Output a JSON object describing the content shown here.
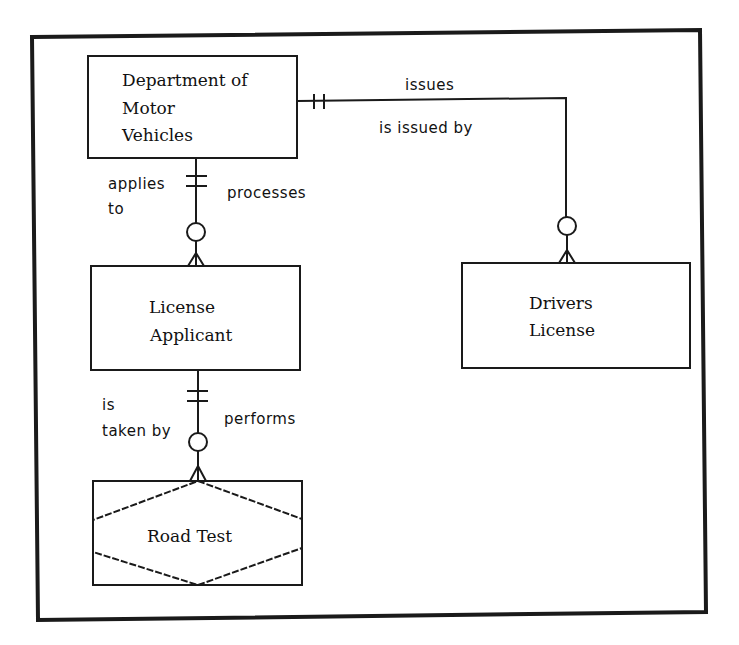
{
  "diagram": {
    "type": "entity-relationship",
    "colors": {
      "line": "#1a1a1a",
      "background": "#ffffff",
      "text": "#111111"
    },
    "entities": [
      {
        "id": "dmv",
        "kind": "entity",
        "lines": [
          "Department of",
          "Motor",
          "Vehicles"
        ]
      },
      {
        "id": "applicant",
        "kind": "entity",
        "lines": [
          "License",
          "Applicant"
        ]
      },
      {
        "id": "drivers_license",
        "kind": "entity",
        "lines": [
          "Drivers",
          "License"
        ]
      },
      {
        "id": "road_test",
        "kind": "associative-entity",
        "lines": [
          "Road Test"
        ]
      }
    ],
    "relationships": [
      {
        "from": "dmv",
        "to": "drivers_license",
        "forward_label": "issues",
        "reverse_label": "is issued by",
        "from_cardinality": "one-and-only-one",
        "to_cardinality": "zero-or-many"
      },
      {
        "from": "dmv",
        "to": "applicant",
        "forward_label": "processes",
        "reverse_label_line1": "applies",
        "reverse_label_line2": "to",
        "from_cardinality": "one-and-only-one",
        "to_cardinality": "zero-or-many"
      },
      {
        "from": "applicant",
        "to": "road_test",
        "forward_label": "performs",
        "reverse_label_line1": "is",
        "reverse_label_line2": "taken by",
        "from_cardinality": "one-and-only-one",
        "to_cardinality": "zero-or-many"
      }
    ]
  }
}
